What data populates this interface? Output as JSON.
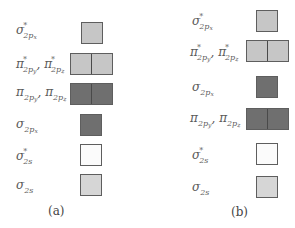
{
  "colors": {
    "light": "#c6c6c6",
    "dark": "#6f6f6f",
    "white": "#fbfbfb",
    "pale": "#d6d6d6"
  },
  "panels": [
    {
      "caption": "(a)",
      "levels": [
        {
          "orbital": "σ*2px",
          "base": "σ",
          "star": "*",
          "sub": "2p",
          "sub2": "x",
          "boxes": 1,
          "fill": "light"
        },
        {
          "orbital": "π*2py, π*2pz",
          "base": "π",
          "star": "*",
          "sub": "2p",
          "sub2": "y",
          "base_b": "π",
          "star_b": "*",
          "sub_b": "2p",
          "sub2_b": "z",
          "boxes": 2,
          "fill": "light"
        },
        {
          "orbital": "π2py, π2pz",
          "base": "π",
          "sub": "2p",
          "sub2": "y",
          "base_b": "π",
          "sub_b": "2p",
          "sub2_b": "z",
          "boxes": 2,
          "fill": "dark"
        },
        {
          "orbital": "σ2px",
          "base": "σ",
          "sub": "2p",
          "sub2": "x",
          "boxes": 1,
          "fill": "dark"
        },
        {
          "orbital": "σ*2s",
          "base": "σ",
          "star": "*",
          "sub": "2s",
          "boxes": 1,
          "fill": "white"
        },
        {
          "orbital": "σ2s",
          "base": "σ",
          "sub": "2s",
          "boxes": 1,
          "fill": "pale"
        }
      ]
    },
    {
      "caption": "(b)",
      "levels": [
        {
          "orbital": "σ*2px",
          "base": "σ",
          "star": "*",
          "sub": "2p",
          "sub2": "x",
          "boxes": 1,
          "fill": "light"
        },
        {
          "orbital": "π*2py, π*2pz",
          "base": "π",
          "star": "*",
          "sub": "2p",
          "sub2": "y",
          "base_b": "π",
          "star_b": "*",
          "sub_b": "2p",
          "sub2_b": "z",
          "boxes": 2,
          "fill": "light"
        },
        {
          "orbital": "σ2px",
          "base": "σ",
          "sub": "2p",
          "sub2": "x",
          "boxes": 1,
          "fill": "dark"
        },
        {
          "orbital": "π2py, π2pz",
          "base": "π",
          "sub": "2p",
          "sub2": "y",
          "base_b": "π",
          "sub_b": "2p",
          "sub2_b": "z",
          "boxes": 2,
          "fill": "dark"
        },
        {
          "orbital": "σ*2s",
          "base": "σ",
          "star": "*",
          "sub": "2s",
          "boxes": 1,
          "fill": "white"
        },
        {
          "orbital": "σ2s",
          "base": "σ",
          "sub": "2s",
          "boxes": 1,
          "fill": "pale"
        }
      ]
    }
  ],
  "separator": ", "
}
